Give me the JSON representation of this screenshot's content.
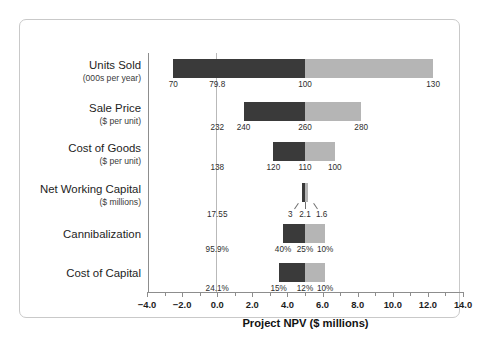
{
  "chart_data": {
    "type": "bar",
    "chart_style": "tornado",
    "title": "",
    "xlabel": "Project NPV ($ millions)",
    "ylabel": "",
    "xlim": [
      -4.0,
      14.0
    ],
    "grid": false,
    "legend": "none",
    "xticks": [
      "−4.0",
      "−2.0",
      "0.0",
      "2.0",
      "4.0",
      "6.0",
      "8.0",
      "10.0",
      "12.0",
      "14.0"
    ],
    "xtick_values": [
      -4.0,
      -2.0,
      0.0,
      2.0,
      4.0,
      6.0,
      8.0,
      10.0,
      12.0,
      14.0
    ],
    "axis_note": "vertical reference line drawn at NPV = 0.0",
    "categories": [
      {
        "name": "Units Sold",
        "unit": "(000s per year)",
        "base_label": "79.8",
        "base_npv": 0.0,
        "low_label": "70",
        "mid_label": "100",
        "high_label": "130",
        "npv_low": -2.5,
        "npv_mid": 5.0,
        "npv_high": 12.3
      },
      {
        "name": "Sale Price",
        "unit": "($ per unit)",
        "base_label": "232",
        "base_npv": 0.0,
        "low_label": "240",
        "mid_label": "260",
        "high_label": "280",
        "npv_low": 1.5,
        "npv_mid": 5.0,
        "npv_high": 8.2
      },
      {
        "name": "Cost of Goods",
        "unit": "($ per unit)",
        "base_label": "138",
        "base_npv": 0.0,
        "low_label": "120",
        "mid_label": "110",
        "high_label": "100",
        "npv_low": 3.2,
        "npv_mid": 5.0,
        "npv_high": 6.7
      },
      {
        "name": "Net Working Capital",
        "unit": "($ millions)",
        "base_label": "17.55",
        "base_npv": 0.0,
        "low_label": "3",
        "mid_label": "2.1",
        "high_label": "1.6",
        "npv_low": 4.85,
        "npv_mid": 5.0,
        "npv_high": 5.15
      },
      {
        "name": "Cannibalization",
        "unit": "",
        "base_label": "95.9%",
        "base_npv": 0.0,
        "low_label": "40%",
        "mid_label": "25%",
        "high_label": "10%",
        "npv_low": 3.75,
        "npv_mid": 5.0,
        "npv_high": 6.15
      },
      {
        "name": "Cost of Capital",
        "unit": "",
        "base_label": "24.1%",
        "base_npv": 0.0,
        "low_label": "15%",
        "mid_label": "12%",
        "high_label": "10%",
        "npv_low": 3.5,
        "npv_mid": 5.0,
        "npv_high": 6.15
      }
    ],
    "colors": {
      "low_segment": "#3a3a3a",
      "high_segment": "#b5b5b5",
      "axis": "#8d8d8d",
      "reference_line": "#b9b9b9",
      "frame": "#c9c9c9",
      "text": "#1d1d1d",
      "background": "#ffffff"
    }
  }
}
